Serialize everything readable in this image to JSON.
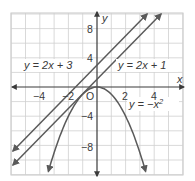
{
  "chart_data": {
    "type": "line",
    "title": "",
    "xlabel": "x",
    "ylabel": "y",
    "xlim": [
      -6,
      6
    ],
    "ylim": [
      -12,
      10
    ],
    "grid": true,
    "grid_step": {
      "x": 1,
      "y": 2
    },
    "x_ticks": [
      -4,
      -2,
      2,
      4
    ],
    "x_tick_labels": [
      "−4",
      "−2",
      "2",
      "4"
    ],
    "y_ticks": [
      8,
      4,
      -4,
      -8
    ],
    "y_tick_labels": [
      "8",
      "4",
      "−4",
      "−8"
    ],
    "origin_label": "O",
    "series": [
      {
        "name": "y = 2x + 3",
        "equation": "y = 2x + 3",
        "kind": "line",
        "slope": 2,
        "intercept": 3,
        "x": [
          -5.9,
          3.5
        ],
        "y": [
          -8.8,
          10
        ]
      },
      {
        "name": "y = 2x + 1",
        "equation": "y = 2x + 1",
        "kind": "line",
        "slope": 2,
        "intercept": 1,
        "x": [
          -5.9,
          4.5
        ],
        "y": [
          -10.8,
          10
        ]
      },
      {
        "name": "y = −x²",
        "equation": "y = -x^2",
        "kind": "parabola",
        "x": [
          -3.4,
          -3,
          -2,
          -1,
          0,
          1,
          2,
          3,
          3.4
        ],
        "y": [
          -11.56,
          -9,
          -4,
          -1,
          0,
          -1,
          -4,
          -9,
          -11.56
        ]
      }
    ],
    "annotations": [
      {
        "text": "y = 2x + 3",
        "near": [
          -4,
          3
        ]
      },
      {
        "text": "y = 2x + 1",
        "near": [
          3.5,
          3
        ]
      },
      {
        "text": "y = −x²",
        "near": [
          3.5,
          -3
        ]
      }
    ]
  },
  "labels": {
    "x_axis": "x",
    "y_axis": "y",
    "origin": "O",
    "eq1": "y = 2x + 3",
    "eq2": "y = 2x + 1",
    "eq3_base": "y = −x",
    "eq3_exp": "2",
    "xt_m4": "−4",
    "xt_m2": "−2",
    "xt_2": "2",
    "xt_4": "4",
    "yt_8": "8",
    "yt_4": "4",
    "yt_m4": "−4",
    "yt_m8": "−8"
  },
  "colors": {
    "grid": "#c8c8c8",
    "axis": "#3a3a3a",
    "curve": "#5a5a5a",
    "text": "#3a3a3a"
  }
}
